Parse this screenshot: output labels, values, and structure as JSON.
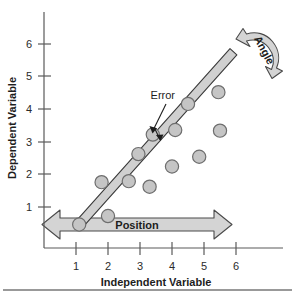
{
  "chart_data": {
    "type": "scatter",
    "title": "",
    "xlabel": "Independent Variable",
    "ylabel": "Dependent Variable",
    "xlim": [
      0,
      6.6
    ],
    "ylim": [
      0,
      6.6
    ],
    "xticks": [
      "1",
      "2",
      "3",
      "4",
      "5",
      "6"
    ],
    "yticks": [
      "1",
      "2",
      "3",
      "4",
      "5",
      "6"
    ],
    "xtick_values": [
      1,
      2,
      3,
      4,
      5,
      6
    ],
    "ytick_values": [
      1,
      2,
      3,
      4,
      5,
      6
    ],
    "grid": false,
    "legend": "none",
    "points": [
      {
        "x": 1.8,
        "y": 2.02
      },
      {
        "x": 2.0,
        "y": 0.98
      },
      {
        "x": 2.65,
        "y": 2.05
      },
      {
        "x": 2.95,
        "y": 2.88
      },
      {
        "x": 3.3,
        "y": 1.88
      },
      {
        "x": 3.4,
        "y": 3.48
      },
      {
        "x": 4.0,
        "y": 2.5
      },
      {
        "x": 4.1,
        "y": 3.62
      },
      {
        "x": 4.5,
        "y": 4.42
      },
      {
        "x": 4.85,
        "y": 2.8
      },
      {
        "x": 5.45,
        "y": 4.78
      },
      {
        "x": 5.5,
        "y": 3.6
      },
      {
        "x": 1.1,
        "y": 0.72
      }
    ],
    "fit_line": {
      "name": "regression-line",
      "x0": 1.08,
      "y0": 0.7,
      "x1": 5.92,
      "y1": 6.02
    },
    "annotations": [
      {
        "name": "error",
        "label": "Error",
        "points_to_x": 3.72,
        "points_to_y": 3.12
      },
      {
        "name": "position",
        "label": "Position"
      },
      {
        "name": "angle",
        "label": "Angle"
      }
    ]
  },
  "colors": {
    "marker_fill": "#c5c5c5",
    "marker_stroke": "#6e6e6e",
    "line_fill": "#d0d0d0",
    "line_stroke": "#3a3a3a",
    "arrow_fill": "#d4d4d4",
    "arrow_stroke": "#4a4a4a",
    "axis": "#5a5a5a",
    "text": "#1d1d1d",
    "rule": "#777777"
  },
  "axes": {
    "x_title": "Independent Variable",
    "y_title": "Dependent Variable"
  },
  "labels": {
    "error": "Error",
    "position": "Position",
    "angle": "Angle"
  }
}
